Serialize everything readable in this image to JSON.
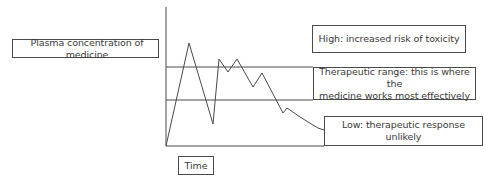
{
  "diagram": {
    "y_axis_label": "Plasma concentration of medicine",
    "x_axis_label": "Time",
    "zones": {
      "high": "High: increased risk of toxicity",
      "therapeutic": "Therapeutic range: this is where the\nmedicine works most effectively",
      "low": "Low: therapeutic response unlikely"
    },
    "colors": {
      "line": "#4a4a4a",
      "text": "#3a3a3a",
      "background": "#ffffff"
    }
  }
}
